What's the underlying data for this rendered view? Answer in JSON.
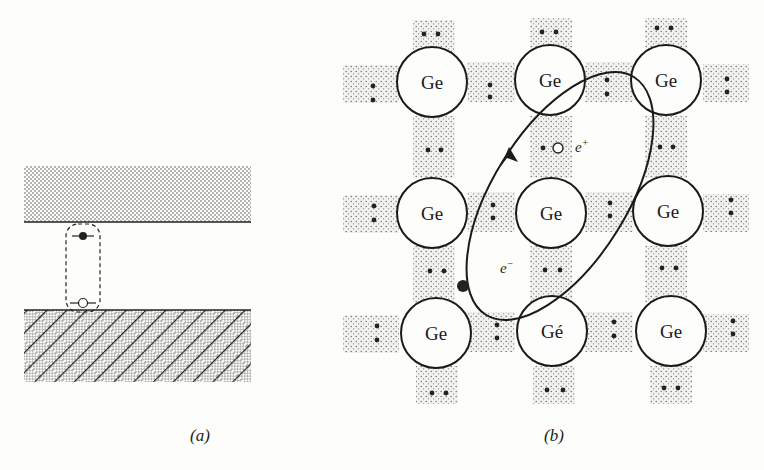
{
  "figure": {
    "panel_a": {
      "caption": "(a)",
      "conduction_band": "dotted band (top)",
      "valence_band": "hatched band (bottom)",
      "exciton_outline": "dashed rounded rectangle",
      "electron_symbol": "filled circle",
      "hole_symbol": "open circle"
    },
    "panel_b": {
      "caption": "(b)",
      "atoms": [
        [
          "Ge",
          "Ge",
          "Ge"
        ],
        [
          "Ge",
          "Ge",
          "Ge"
        ],
        [
          "Ge",
          "Gé",
          "Ge"
        ]
      ],
      "hole_label": "e",
      "hole_sup": "+",
      "electron_label": "e",
      "electron_sup": "−"
    }
  }
}
